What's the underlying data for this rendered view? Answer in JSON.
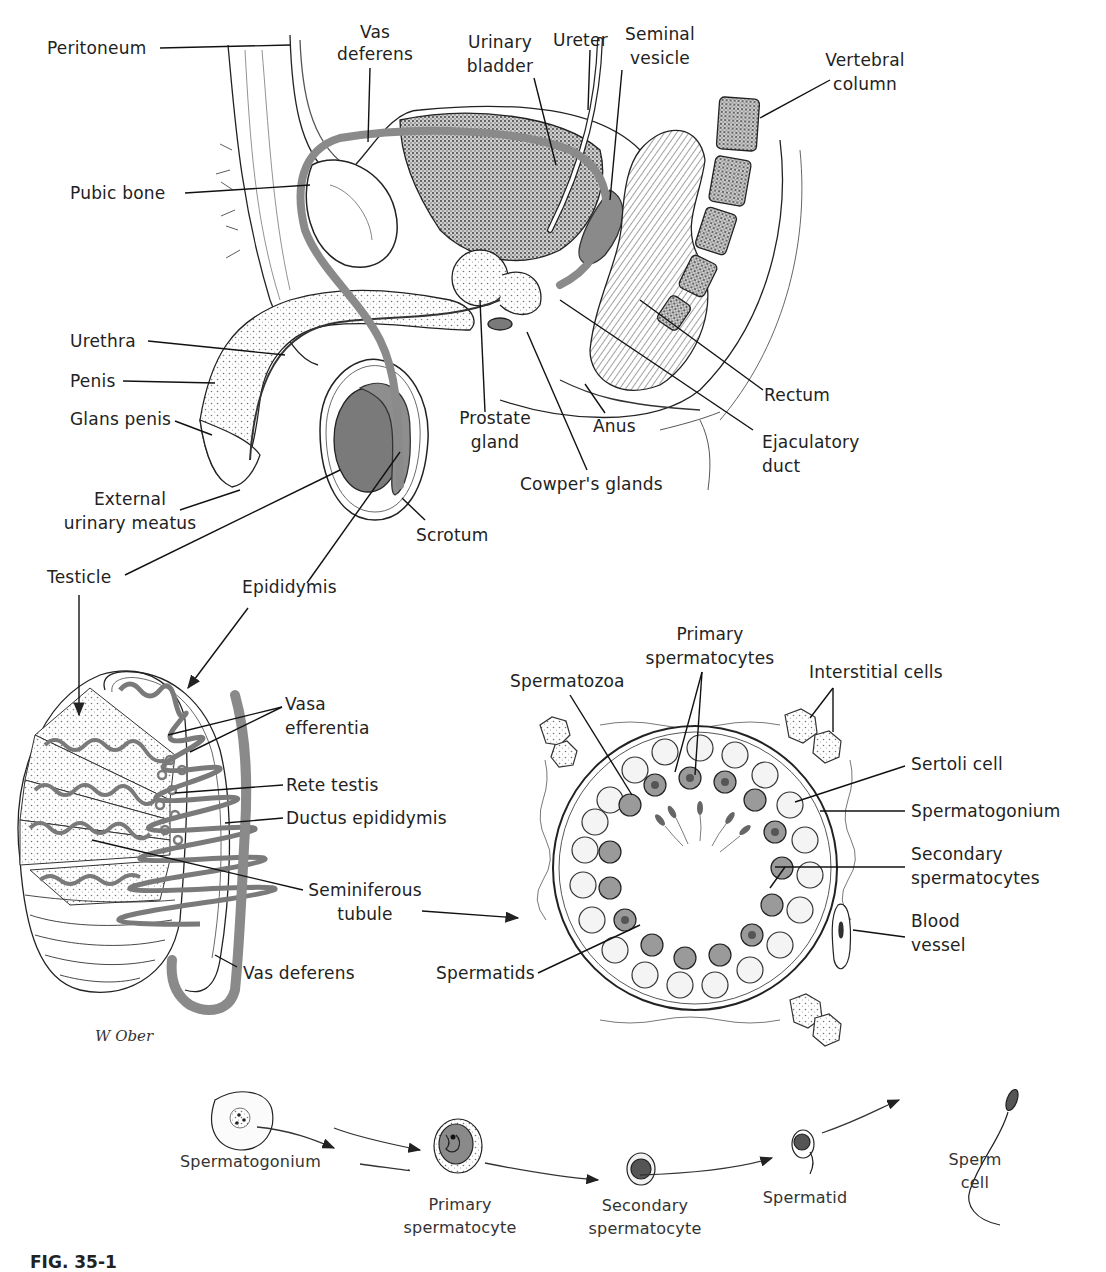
{
  "figure": {
    "signature": "W Ober",
    "caption_partial": "FIG. 35-1"
  },
  "sagittal_section": {
    "labels": {
      "peritoneum": "Peritoneum",
      "vas_deferens_1": "Vas",
      "vas_deferens_2": "deferens",
      "urinary_bladder_1": "Urinary",
      "urinary_bladder_2": "bladder",
      "ureter": "Ureter",
      "seminal_vesicle_1": "Seminal",
      "seminal_vesicle_2": "vesicle",
      "vertebral_column_1": "Vertebral",
      "vertebral_column_2": "column",
      "pubic_bone": "Pubic bone",
      "urethra": "Urethra",
      "penis": "Penis",
      "glans_penis": "Glans penis",
      "external_urinary_meatus_1": "External",
      "external_urinary_meatus_2": "urinary meatus",
      "prostate_gland_1": "Prostate",
      "prostate_gland_2": "gland",
      "anus": "Anus",
      "rectum": "Rectum",
      "ejaculatory_duct_1": "Ejaculatory",
      "ejaculatory_duct_2": "duct",
      "cowpers_glands": "Cowper's glands",
      "scrotum": "Scrotum",
      "testicle": "Testicle",
      "epididymis": "Epididymis"
    }
  },
  "testis_section": {
    "labels": {
      "vasa_efferentia_1": "Vasa",
      "vasa_efferentia_2": "efferentia",
      "rete_testis": "Rete testis",
      "ductus_epididymis": "Ductus epididymis",
      "seminiferous_tubule_1": "Seminiferous",
      "seminiferous_tubule_2": "tubule",
      "vas_deferens": "Vas deferens"
    }
  },
  "tubule_cross_section": {
    "labels": {
      "primary_spermatocytes_1": "Primary",
      "primary_spermatocytes_2": "spermatocytes",
      "spermatozoa": "Spermatozoa",
      "interstitial_cells": "Interstitial cells",
      "sertoli_cell": "Sertoli cell",
      "spermatogonium": "Spermatogonium",
      "secondary_spermatocytes_1": "Secondary",
      "secondary_spermatocytes_2": "spermatocytes",
      "blood_vessel_1": "Blood",
      "blood_vessel_2": "vessel",
      "spermatids": "Spermatids"
    }
  },
  "spermatogenesis_sequence": {
    "stages": [
      {
        "line1": "Spermatogonium",
        "line2": ""
      },
      {
        "line1": "Primary",
        "line2": "spermatocyte"
      },
      {
        "line1": "Secondary",
        "line2": "spermatocyte"
      },
      {
        "line1": "Spermatid",
        "line2": ""
      },
      {
        "line1": "Sperm",
        "line2": "cell"
      }
    ]
  },
  "colors": {
    "ink": "#1e1e1e",
    "duct_gray": "#8a8a8a",
    "organ_gray": "#7a7a7a",
    "light_fill": "#f2f2f2",
    "stipple": "#bdbdbd"
  }
}
